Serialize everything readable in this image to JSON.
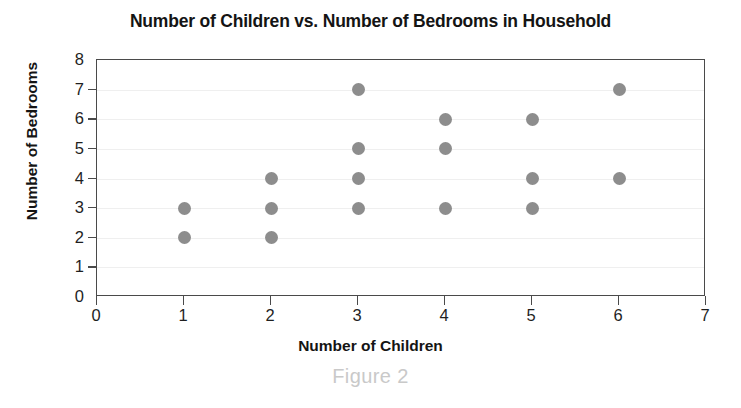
{
  "chart_data": {
    "type": "scatter",
    "title": "Number of Children vs. Number of Bedrooms in Household",
    "xlabel": "Number of Children",
    "ylabel": "Number of Bedrooms",
    "xlim": [
      0,
      7
    ],
    "ylim": [
      0,
      8
    ],
    "xticks": [
      0,
      1,
      2,
      3,
      4,
      5,
      6,
      7
    ],
    "yticks": [
      0,
      1,
      2,
      3,
      4,
      5,
      6,
      7,
      8
    ],
    "grid": "horizontal-only",
    "legend": null,
    "marker_color": "#8d8d8d",
    "marker_shape": "circle",
    "points": [
      {
        "x": 1,
        "y": 3
      },
      {
        "x": 1,
        "y": 2
      },
      {
        "x": 2,
        "y": 4
      },
      {
        "x": 2,
        "y": 3
      },
      {
        "x": 2,
        "y": 2
      },
      {
        "x": 3,
        "y": 7
      },
      {
        "x": 3,
        "y": 5
      },
      {
        "x": 3,
        "y": 4
      },
      {
        "x": 3,
        "y": 3
      },
      {
        "x": 4,
        "y": 6
      },
      {
        "x": 4,
        "y": 5
      },
      {
        "x": 4,
        "y": 3
      },
      {
        "x": 5,
        "y": 6
      },
      {
        "x": 5,
        "y": 4
      },
      {
        "x": 5,
        "y": 3
      },
      {
        "x": 6,
        "y": 7
      },
      {
        "x": 6,
        "y": 4
      }
    ]
  },
  "caption": "Figure 2"
}
